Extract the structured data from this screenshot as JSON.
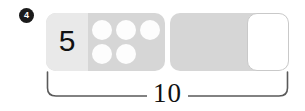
{
  "exercise": {
    "number": "4",
    "total_label": "10",
    "numeral_label": "5"
  },
  "bars": {
    "left": {
      "name": "five-bar",
      "numeral": "5",
      "dot_count": 5,
      "dots": [
        {
          "row": 0,
          "col": 0
        },
        {
          "row": 0,
          "col": 1
        },
        {
          "row": 0,
          "col": 2
        },
        {
          "row": 1,
          "col": 0
        },
        {
          "row": 1,
          "col": 1
        }
      ]
    },
    "right": {
      "name": "unknown-bar",
      "numeral": "",
      "has_empty_cell": true
    }
  },
  "colors": {
    "bar_fill": "#d6d6d6",
    "numeral_cell_fill": "#e9e9e9",
    "dot_fill": "#fdfdfd",
    "empty_cell_fill": "#ffffff",
    "empty_cell_border": "#c9c9c9",
    "badge_fill": "#1b1b1b",
    "badge_text": "#ffffff",
    "text": "#111111",
    "brace_stroke": "#5a5a5a",
    "page_background": "#ffffff"
  }
}
